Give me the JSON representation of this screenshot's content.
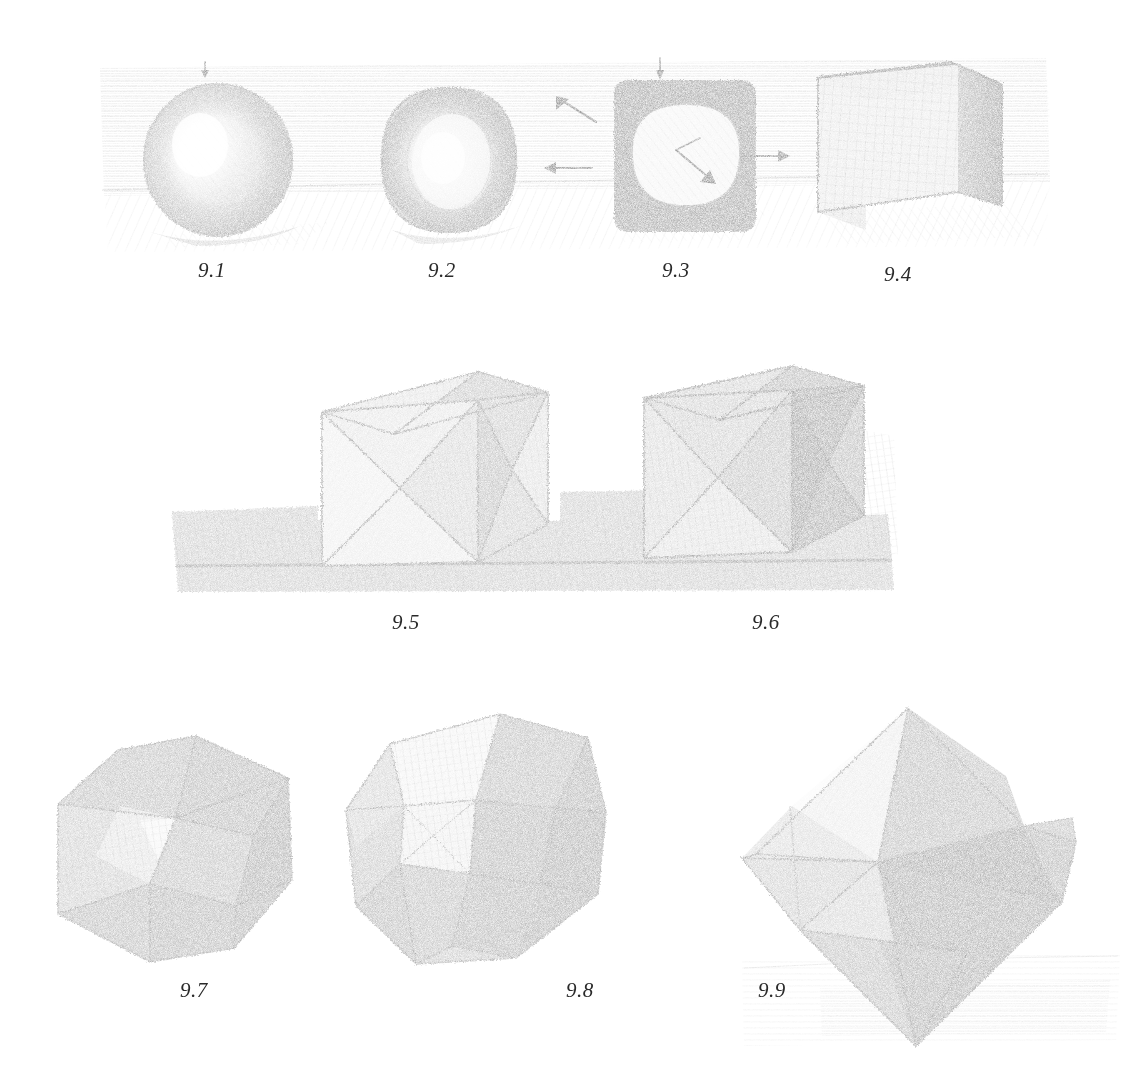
{
  "plate": {
    "medium": "graphite pencil drawing on white paper",
    "title_visible": false,
    "background_color": "#ffffff",
    "ink_color": "#3a3a3a"
  },
  "figures": [
    {
      "id": "9.1",
      "label": "9.1",
      "subject": "shaded sphere resting on hatched horizontal plane",
      "label_x": 198,
      "label_y": 262,
      "center_x": 218,
      "center_y": 160,
      "radius": 72
    },
    {
      "id": "9.2",
      "label": "9.2",
      "subject": "sphere beginning to flatten toward a cube, rounded block",
      "label_x": 428,
      "label_y": 262,
      "center_x": 449,
      "center_y": 160,
      "radius": 70
    },
    {
      "id": "9.3",
      "label": "9.3",
      "subject": "rounded cube, circle inscribed in square silhouette, with direction arrows",
      "label_x": 662,
      "label_y": 262,
      "center_x": 683,
      "center_y": 158,
      "radius": 70
    },
    {
      "id": "9.4",
      "label": "9.4",
      "subject": "fully resolved cube drawn in perspective with cross-hatched faces",
      "label_x": 884,
      "label_y": 264,
      "center_x": 910,
      "center_y": 155,
      "radius": 80
    },
    {
      "id": "9.5",
      "label": "9.5",
      "subject": "cube with concave pyramidal hollows carved into each visible face, light value",
      "label_x": 392,
      "label_y": 615,
      "center_x": 420,
      "center_y": 470,
      "radius": 110
    },
    {
      "id": "9.6",
      "label": "9.6",
      "subject": "same hollow-faced cube rendered in darker value, cast shadow to the right",
      "label_x": 752,
      "label_y": 615,
      "center_x": 762,
      "center_y": 465,
      "radius": 110
    },
    {
      "id": "9.7",
      "label": "9.7",
      "subject": "rhombic-faceted polyhedron (cube with pyramids on faces), three-quarter view",
      "label_x": 180,
      "label_y": 985,
      "center_x": 168,
      "center_y": 855,
      "radius": 125
    },
    {
      "id": "9.8",
      "label": "9.8",
      "subject": "rhombic dodecahedron tilted, lighter upper facets and dark lower facets",
      "label_x": 566,
      "label_y": 985,
      "center_x": 470,
      "center_y": 860,
      "radius": 130
    },
    {
      "id": "9.9",
      "label": "9.9",
      "subject": "stellated octahedron / star polyhedron standing on a point over hatched ground",
      "label_x": 758,
      "label_y": 985,
      "center_x": 905,
      "center_y": 880,
      "radius": 175
    }
  ],
  "annotations": {
    "arrows": [
      {
        "name": "arrow-left-between-9-2-and-9-3",
        "direction": "left",
        "x1": 590,
        "y1": 168,
        "x2": 546,
        "y2": 168
      },
      {
        "name": "arrow-right-between-9-3-and-9-4",
        "direction": "right",
        "x1": 742,
        "y1": 156,
        "x2": 790,
        "y2": 156
      },
      {
        "name": "arrow-up-left-above-9-3",
        "direction": "up-right",
        "x1": 592,
        "y1": 120,
        "x2": 556,
        "y2": 98
      },
      {
        "name": "arrow-radius-inside-9-3",
        "direction": "down-right",
        "x1": 680,
        "y1": 152,
        "x2": 716,
        "y2": 182
      },
      {
        "name": "arrow-tick-top-9-1",
        "direction": "down",
        "x1": 205,
        "y1": 64,
        "x2": 205,
        "y2": 76
      },
      {
        "name": "arrow-tick-top-9-3",
        "direction": "down",
        "x1": 660,
        "y1": 62,
        "x2": 660,
        "y2": 76
      }
    ]
  },
  "rows": [
    {
      "name": "row-top-sphere-to-cube",
      "figures": [
        "9.1",
        "9.2",
        "9.3",
        "9.4"
      ]
    },
    {
      "name": "row-middle-hollow-cubes",
      "figures": [
        "9.5",
        "9.6"
      ]
    },
    {
      "name": "row-bottom-polyhedra",
      "figures": [
        "9.7",
        "9.8",
        "9.9"
      ]
    }
  ]
}
